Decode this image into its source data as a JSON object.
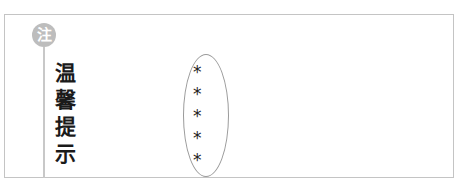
{
  "note_box": {
    "badge_label": "注",
    "title_chars": [
      "温",
      "馨",
      "提",
      "示"
    ],
    "items": [
      "*",
      "*",
      "*",
      "*",
      "*"
    ],
    "colors": {
      "badge_bg": "#bdbdbd",
      "border": "#c4c4c4",
      "text": "#1a1a1a"
    }
  }
}
